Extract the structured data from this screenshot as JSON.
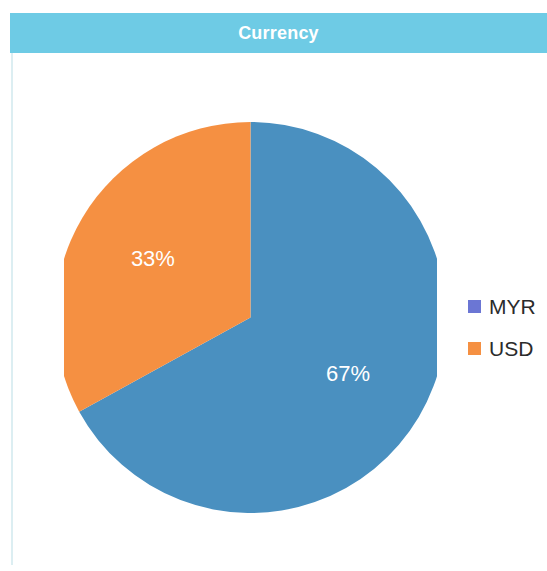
{
  "header": {
    "title": "Currency",
    "background_color": "#6ecbe5",
    "text_color": "#ffffff"
  },
  "panel": {
    "background_color": "#ffffff",
    "rule_color": "#dceef2"
  },
  "legend": {
    "position": "right",
    "items": [
      {
        "label": "MYR",
        "color": "#6b76d4"
      },
      {
        "label": "USD",
        "color": "#f59042"
      }
    ]
  },
  "chart_data": {
    "type": "pie",
    "title": "Currency",
    "xlabel": "",
    "ylabel": "",
    "categories": [
      "MYR",
      "USD"
    ],
    "values": [
      67,
      33
    ],
    "value_unit": "%",
    "data_labels": [
      "67%",
      "33%"
    ],
    "slice_colors": [
      "#4a90c0",
      "#f59042"
    ],
    "legend_colors": [
      "#6b76d4",
      "#f59042"
    ],
    "legend_entries": [
      "MYR",
      "USD"
    ],
    "start_angle_deg": 0,
    "direction": "clockwise",
    "grid": false,
    "legend_position": "right",
    "label_text_color": "#ffffff"
  },
  "pie_render": {
    "blue_path": "M 186.5 195.5 L 186.5 0 A 195.5 195.5 0 1 1 84.8 363.6 Z",
    "orange_path": "M 186.5 195.5 L 84.8 363.6 A 195.5 195.5 0 0 1 186.5 0 Z",
    "label_67": {
      "x": 277,
      "y": 234,
      "text": "67%"
    },
    "label_33": {
      "x": 121,
      "y": 145,
      "text": "33%"
    }
  }
}
